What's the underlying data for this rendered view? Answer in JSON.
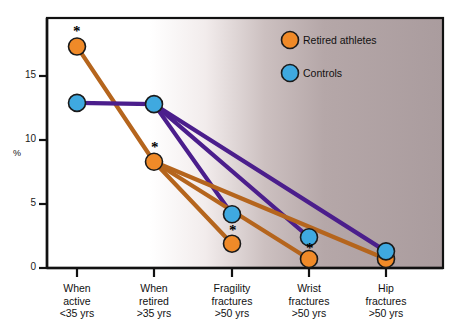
{
  "chart_data": {
    "type": "line",
    "title": "",
    "xlabel": "",
    "ylabel": "%",
    "ylim": [
      0,
      19
    ],
    "yticks": [
      0,
      5,
      10,
      15
    ],
    "grid": false,
    "legend_position": "top-right",
    "categories": [
      "When active <35 yrs",
      "When retired >35 yrs",
      "Fragility fractures >50 yrs",
      "Wrist fractures >50 yrs",
      "Hip fractures >50 yrs"
    ],
    "category_lines": [
      [
        "When",
        "active",
        "<35 yrs"
      ],
      [
        "When",
        "retired",
        ">35 yrs"
      ],
      [
        "Fragility",
        "fractures",
        ">50 yrs"
      ],
      [
        "Wrist",
        "fractures",
        ">50 yrs"
      ],
      [
        "Hip",
        "fractures",
        ">50 yrs"
      ]
    ],
    "series": [
      {
        "name": "Retired athletes",
        "color": "#F08A28",
        "line_color": "#B5651D",
        "values": [
          17.3,
          8.3,
          1.9,
          0.7,
          0.7
        ],
        "significant": [
          true,
          true,
          true,
          true,
          false
        ]
      },
      {
        "name": "Controls",
        "color": "#3FA9E0",
        "line_color": "#4B1E8C",
        "values": [
          12.9,
          12.8,
          4.2,
          2.4,
          1.3
        ],
        "significant": [
          false,
          false,
          false,
          false,
          false
        ]
      }
    ],
    "connections": [
      {
        "series": "Controls",
        "from": 1,
        "to": 2
      },
      {
        "series": "Controls",
        "from": 1,
        "to": 3
      },
      {
        "series": "Controls",
        "from": 1,
        "to": 4
      },
      {
        "series": "Retired athletes",
        "from": 1,
        "to": 2
      },
      {
        "series": "Retired athletes",
        "from": 1,
        "to": 3
      },
      {
        "series": "Retired athletes",
        "from": 1,
        "to": 4
      }
    ],
    "significance_marker": "*"
  },
  "legend": {
    "items": [
      {
        "label": "Retired athletes",
        "color": "#F08A28"
      },
      {
        "label": "Controls",
        "color": "#3FA9E0"
      }
    ]
  },
  "axis": {
    "y_title": "%",
    "y_tick_labels": [
      "15",
      "10",
      "5",
      "0"
    ]
  }
}
